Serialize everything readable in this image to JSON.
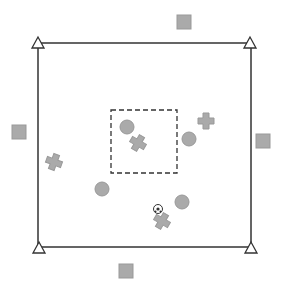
{
  "diagram": {
    "colors": {
      "line": "#333333",
      "marker": "#aaaaaa",
      "marker_stroke": "#999999",
      "background": "#ffffff"
    },
    "field": {
      "shape": "square",
      "corner_markers": "cone-triangles",
      "corners": 4
    },
    "center_zone": {
      "style": "dashed"
    },
    "outside_squares": [
      "top",
      "left",
      "right",
      "bottom"
    ],
    "players_circles": 5,
    "players_crosses": 4,
    "ball": 1
  }
}
